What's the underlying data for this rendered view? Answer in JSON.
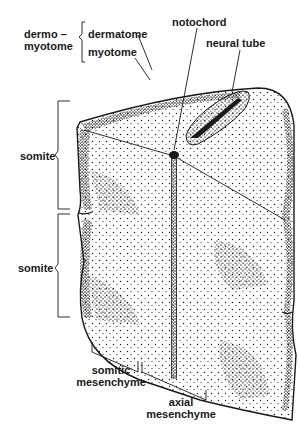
{
  "diagram": {
    "type": "anatomical-illustration",
    "colors": {
      "ink": "#1a1a1a",
      "background": "#ffffff"
    }
  },
  "labels": {
    "dermomyotome_line1": "dermo –",
    "dermomyotome_line2": "myotome",
    "dermatome": "dermatome",
    "myotome": "myotome",
    "notochord": "notochord",
    "neural_tube": "neural tube",
    "somite_upper": "somite",
    "somite_lower": "somite",
    "somitic_mesenchyme_line1": "somitic",
    "somitic_mesenchyme_line2": "mesenchyme",
    "axial_mesenchyme_line1": "axial",
    "axial_mesenchyme_line2": "mesenchyme"
  }
}
